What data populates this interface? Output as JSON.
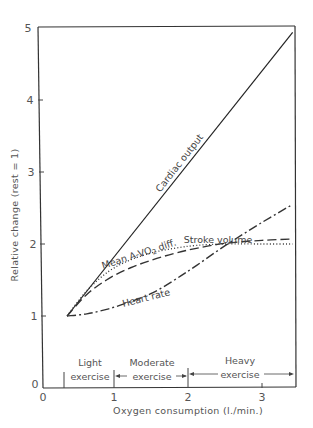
{
  "chart_data": {
    "type": "line",
    "title": "",
    "xlabel": "Oxygen consumption (l./min.)",
    "ylabel": "Relative change (rest = 1)",
    "xlim": [
      0,
      3.45
    ],
    "ylim": [
      0,
      5
    ],
    "x_ticks": [
      0,
      1,
      2,
      3
    ],
    "y_ticks": [
      0,
      1,
      2,
      3,
      4,
      5
    ],
    "grid": false,
    "legend": "inline labels on curves",
    "series": [
      {
        "name": "Cardiac output",
        "style": "solid",
        "x": [
          0.33,
          3.42
        ],
        "y": [
          1.0,
          4.94
        ]
      },
      {
        "name": "Stroke volume",
        "style": "dotted",
        "x": [
          0.33,
          0.6,
          0.9,
          1.2,
          1.5,
          1.8,
          2.1,
          2.5,
          3.0,
          3.42
        ],
        "y": [
          1.0,
          1.35,
          1.62,
          1.78,
          1.88,
          1.94,
          1.98,
          2.0,
          2.0,
          2.0
        ]
      },
      {
        "name": "Mean A-VO2 diff.",
        "style": "dashed",
        "x": [
          0.33,
          0.6,
          0.9,
          1.2,
          1.5,
          1.8,
          2.1,
          2.5,
          3.0,
          3.42
        ],
        "y": [
          1.0,
          1.3,
          1.52,
          1.67,
          1.78,
          1.87,
          1.94,
          2.01,
          2.05,
          2.07
        ]
      },
      {
        "name": "Heart rate",
        "style": "dash-dot",
        "x": [
          0.33,
          0.6,
          0.9,
          1.2,
          1.5,
          1.8,
          2.1,
          2.5,
          3.0,
          3.42
        ],
        "y": [
          1.0,
          1.03,
          1.1,
          1.2,
          1.32,
          1.5,
          1.7,
          1.98,
          2.3,
          2.55
        ]
      }
    ],
    "annotations": [
      {
        "text": "Light exercise",
        "x_range": [
          0.3,
          1.0
        ]
      },
      {
        "text": "Moderate exercise",
        "x_range": [
          1.0,
          2.0
        ]
      },
      {
        "text": "Heavy exercise",
        "x_range": [
          2.0,
          3.42
        ]
      }
    ]
  },
  "labels": {
    "xlabel": "Oxygen consumption (l./min.)",
    "ylabel": "Relative change (rest = 1)",
    "cardiac_output": "Cardiac output",
    "stroke_volume": "Stroke volume",
    "avo2_prefix": "Mean A-VO",
    "avo2_sub": "2",
    "avo2_suffix": " diff.",
    "heart_rate": "Heart rate",
    "light_1": "Light",
    "light_2": "exercise",
    "moderate_1": "Moderate",
    "moderate_2": "exercise",
    "heavy_1": "Heavy",
    "heavy_2": "exercise",
    "y0": "0",
    "y1": "1",
    "y2": "2",
    "y3": "3",
    "y4": "4",
    "y5": "5",
    "x0": "0",
    "x1": "1",
    "x2": "2",
    "x3": "3"
  }
}
